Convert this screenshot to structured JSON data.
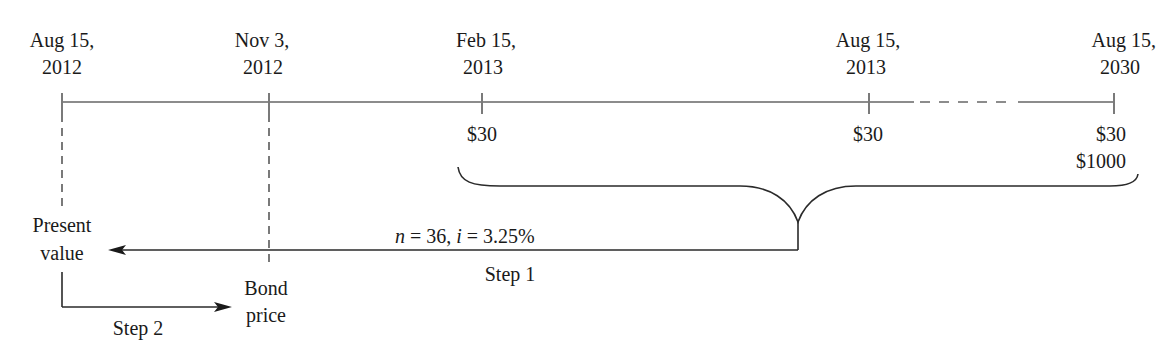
{
  "diagram": {
    "type": "bond-price-timeline",
    "dates": [
      {
        "line1": "Aug 15,",
        "line2": "2012"
      },
      {
        "line1": "Nov 3,",
        "line2": "2012"
      },
      {
        "line1": "Feb 15,",
        "line2": "2013"
      },
      {
        "line1": "Aug 15,",
        "line2": "2013"
      },
      {
        "line1": "Aug 15,",
        "line2": "2030"
      }
    ],
    "payments": [
      {
        "amount": "$30"
      },
      {
        "amount": "$30"
      },
      {
        "amount": "$30",
        "face": "$1000"
      }
    ],
    "step1": {
      "formula": "n = 36, i = 3.25%",
      "n_var": "n",
      "n_rest": " = 36, ",
      "i_var": "i",
      "i_rest": " = 3.25%",
      "label": "Step 1"
    },
    "present_value": {
      "line1": "Present",
      "line2": "value"
    },
    "bond_price": {
      "line1": "Bond",
      "line2": "price"
    },
    "step2": {
      "label": "Step 2"
    },
    "colors": {
      "timeline": "#8c8c8c",
      "ink": "#1a1a1a"
    }
  }
}
